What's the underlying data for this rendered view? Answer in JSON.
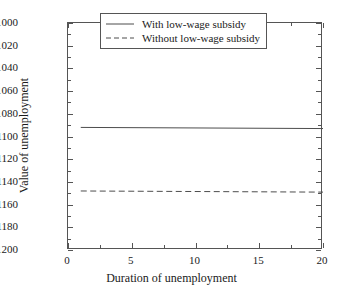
{
  "chart_data": {
    "type": "line",
    "title": "",
    "xlabel": "Duration of unemployment",
    "ylabel": "Value of unemployment",
    "xlim": [
      0,
      20
    ],
    "ylim": [
      -1200,
      -1000
    ],
    "xticks": [
      "0",
      "5",
      "10",
      "15",
      "20"
    ],
    "xtick_values": [
      0,
      5,
      10,
      15,
      20
    ],
    "xminor_values": [
      2.5,
      7.5,
      12.5,
      17.5
    ],
    "yticks": [
      "−1000",
      "−1020",
      "−1040",
      "−1060",
      "−1080",
      "−1100",
      "−1120",
      "−1140",
      "−1160",
      "−1180",
      "−1200"
    ],
    "ytick_values": [
      -1000,
      -1020,
      -1040,
      -1060,
      -1080,
      -1100,
      -1120,
      -1140,
      -1160,
      -1180,
      -1200
    ],
    "grid": false,
    "legend_position": "upper center-right",
    "series": [
      {
        "name": "With low-wage subsidy",
        "style": "solid",
        "color": "#4d4d4d",
        "x": [
          1,
          20
        ],
        "values": [
          -1092,
          -1093
        ]
      },
      {
        "name": "Without low-wage subsidy",
        "style": "dashed",
        "color": "#4d4d4d",
        "x": [
          1,
          20
        ],
        "values": [
          -1148,
          -1149
        ]
      }
    ]
  },
  "legend": {
    "entries": [
      {
        "label": "With low-wage subsidy"
      },
      {
        "label": "Without low-wage subsidy"
      }
    ]
  }
}
